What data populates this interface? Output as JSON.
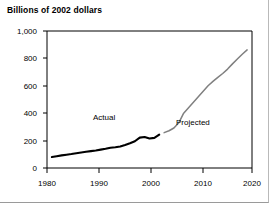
{
  "chart_data": {
    "type": "line",
    "title": "Billions of 2002 dollars",
    "xlabel": "",
    "ylabel": "",
    "xlim": [
      1979,
      2021
    ],
    "ylim": [
      0,
      1000
    ],
    "grid": false,
    "legend_position": "inline-annotation",
    "ytick_labels": [
      "1,000",
      "800",
      "600",
      "400",
      "200",
      "0"
    ],
    "ytick_values": [
      1000,
      800,
      600,
      400,
      200,
      0
    ],
    "xtick_labels": [
      "1980",
      "1990",
      "2000",
      "2010",
      "2020"
    ],
    "xtick_values": [
      1980,
      1990,
      2000,
      2010,
      2020
    ],
    "annotations": [
      {
        "text": "Actual",
        "x": 1994.5,
        "y": 330
      },
      {
        "text": "Projected",
        "x": 2009.5,
        "y": 290
      }
    ],
    "series": [
      {
        "name": "Actual",
        "color": "#000000",
        "x": [
          1980,
          1981,
          1982,
          1983,
          1984,
          1985,
          1986,
          1987,
          1988,
          1989,
          1990,
          1991,
          1992,
          1993,
          1994,
          1995,
          1996,
          1997,
          1998,
          1999,
          2000,
          2001,
          2002
        ],
        "values": [
          80,
          86,
          92,
          97,
          102,
          108,
          113,
          118,
          123,
          128,
          134,
          140,
          148,
          152,
          157,
          168,
          180,
          195,
          222,
          226,
          215,
          220,
          243
        ]
      },
      {
        "name": "Projected",
        "color": "#808080",
        "x": [
          2003,
          2004,
          2005,
          2006,
          2007,
          2008,
          2009,
          2010,
          2011,
          2012,
          2013,
          2014,
          2015,
          2016,
          2017,
          2018,
          2019,
          2020
        ],
        "values": [
          258,
          272,
          292,
          330,
          400,
          440,
          480,
          520,
          560,
          600,
          632,
          662,
          690,
          722,
          760,
          795,
          830,
          862
        ]
      }
    ]
  }
}
